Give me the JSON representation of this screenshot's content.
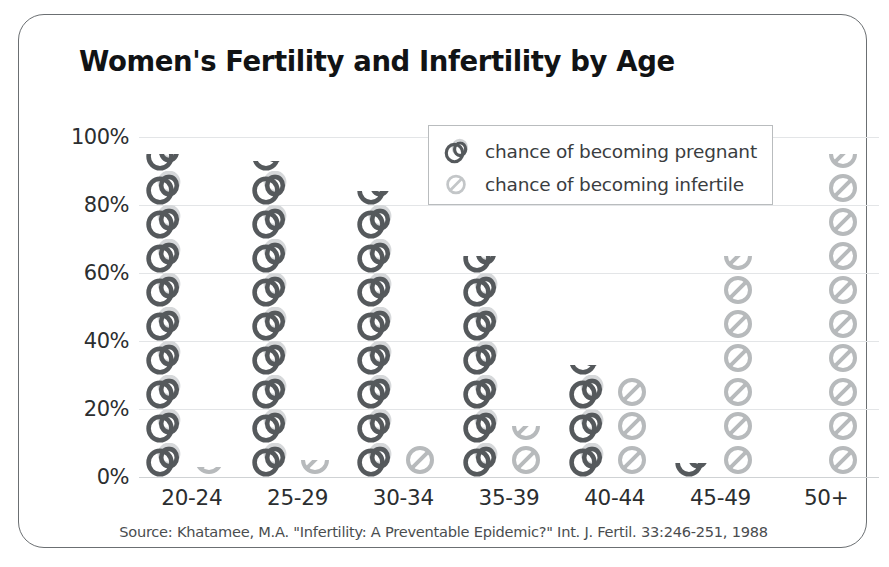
{
  "chart_data": {
    "type": "bar",
    "title": "Women's Fertility and Infertility by Age",
    "xlabel": "",
    "ylabel": "",
    "ylim": [
      0,
      100
    ],
    "ytick_labels": [
      "0%",
      "20%",
      "40%",
      "60%",
      "80%",
      "100%"
    ],
    "ytick_values": [
      0,
      20,
      40,
      60,
      80,
      100
    ],
    "grid": true,
    "legend_position": "top-center",
    "pictogram": true,
    "icon_unit_percent": 10,
    "categories": [
      "20-24",
      "25-29",
      "30-34",
      "35-39",
      "40-44",
      "45-49",
      "50+"
    ],
    "series": [
      {
        "name": "chance of becoming pregnant",
        "icon": "wedding-rings-icon",
        "color": "#55595c",
        "values": [
          95,
          93,
          84,
          65,
          33,
          4,
          0
        ]
      },
      {
        "name": "chance of becoming infertile",
        "icon": "no-entry-icon",
        "color": "#b7babc",
        "values": [
          3,
          5,
          9,
          15,
          30,
          65,
          95
        ]
      }
    ],
    "annotations": [
      "Source: Khatamee, M.A. \"Infertility: A Preventable Epidemic?\" Int. J. Fertil. 33:246-251, 1988"
    ]
  },
  "title": "Women's Fertility and Infertility by Age",
  "legend": {
    "items": [
      {
        "label": "chance of becoming pregnant",
        "icon": "wedding-rings-icon"
      },
      {
        "label": "chance of becoming infertile",
        "icon": "no-entry-icon"
      }
    ]
  },
  "source": "Source: Khatamee, M.A. \"Infertility: A Preventable Epidemic?\" Int. J. Fertil. 33:246-251, 1988",
  "colors": {
    "pregnant": "#55595c",
    "infertile": "#b7babc",
    "grid": "#e3e5e7",
    "text": "#2b2e30",
    "frame": "#6b6f72"
  }
}
